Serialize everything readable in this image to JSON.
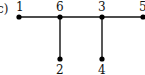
{
  "figure": {
    "panel_label": "c)",
    "type": "tree",
    "nodes": [
      {
        "id": "1",
        "label": "1",
        "x": 19,
        "y": 17,
        "label_pos": "above"
      },
      {
        "id": "6",
        "label": "6",
        "x": 60,
        "y": 17,
        "label_pos": "above"
      },
      {
        "id": "3",
        "label": "3",
        "x": 102,
        "y": 17,
        "label_pos": "above"
      },
      {
        "id": "5",
        "label": "5",
        "x": 142,
        "y": 17,
        "label_pos": "above"
      },
      {
        "id": "2",
        "label": "2",
        "x": 60,
        "y": 59,
        "label_pos": "below"
      },
      {
        "id": "4",
        "label": "4",
        "x": 102,
        "y": 59,
        "label_pos": "below"
      }
    ],
    "edges": [
      {
        "from": "1",
        "to": "6"
      },
      {
        "from": "6",
        "to": "3"
      },
      {
        "from": "3",
        "to": "5"
      },
      {
        "from": "6",
        "to": "2"
      },
      {
        "from": "3",
        "to": "4"
      }
    ],
    "colors": {
      "line": "#111111",
      "node": "#000000",
      "background": "#ffffff"
    }
  }
}
